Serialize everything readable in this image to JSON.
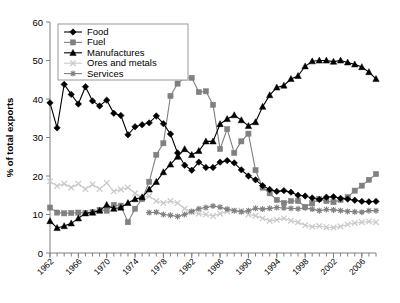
{
  "chart_data": {
    "type": "line",
    "title": "",
    "xlabel": "",
    "ylabel": "% of total exports",
    "ylim": [
      0,
      60
    ],
    "yticks": [
      0,
      10,
      20,
      30,
      40,
      50,
      60
    ],
    "xlim": [
      1962,
      2008
    ],
    "xticks": [
      1962,
      1966,
      1970,
      1974,
      1978,
      1982,
      1986,
      1990,
      1994,
      1998,
      2002,
      2006
    ],
    "xtick_step_minor": 1,
    "grid": false,
    "legend_position": "top-left-inside",
    "x": [
      1962,
      1963,
      1964,
      1965,
      1966,
      1967,
      1968,
      1969,
      1970,
      1971,
      1972,
      1973,
      1974,
      1975,
      1976,
      1977,
      1978,
      1979,
      1980,
      1981,
      1982,
      1983,
      1984,
      1985,
      1986,
      1987,
      1988,
      1989,
      1990,
      1991,
      1992,
      1993,
      1994,
      1995,
      1996,
      1997,
      1998,
      1999,
      2000,
      2001,
      2002,
      2003,
      2004,
      2005,
      2006,
      2007,
      2008
    ],
    "series": [
      {
        "name": "Food",
        "marker": "diamond",
        "color": "#000000",
        "values": [
          39.0,
          32.5,
          43.8,
          41.2,
          38.7,
          43.2,
          39.5,
          38.2,
          39.7,
          36.3,
          35.7,
          30.7,
          32.8,
          33.3,
          33.8,
          35.6,
          33.6,
          30.9,
          26.0,
          22.8,
          21.5,
          23.6,
          22.2,
          22.2,
          23.6,
          24.0,
          23.4,
          21.6,
          20.0,
          19.0,
          17.5,
          16.5,
          16.0,
          16.2,
          15.8,
          15.0,
          14.8,
          14.3,
          13.9,
          14.5,
          14.6,
          14.2,
          14.0,
          13.7,
          13.4,
          13.3,
          13.4
        ]
      },
      {
        "name": "Fuel",
        "marker": "square",
        "color": "#808080",
        "values": [
          11.8,
          10.5,
          10.3,
          10.4,
          10.5,
          10.4,
          10.6,
          11.2,
          11.0,
          12.5,
          12.3,
          8.0,
          11.5,
          14.0,
          18.5,
          25.5,
          28.5,
          40.8,
          44.0,
          45.6,
          45.5,
          41.8,
          42.0,
          38.5,
          27.0,
          32.2,
          26.0,
          29.0,
          31.0,
          21.5,
          17.0,
          15.5,
          13.8,
          13.0,
          13.5,
          13.5,
          12.0,
          12.9,
          14.0,
          13.5,
          13.2,
          13.8,
          14.5,
          16.2,
          17.5,
          19.0,
          20.5
        ]
      },
      {
        "name": "Manufactures",
        "marker": "triangle",
        "color": "#000000",
        "values": [
          8.3,
          6.5,
          7.0,
          7.7,
          9.0,
          10.3,
          10.5,
          11.0,
          12.5,
          11.5,
          11.8,
          13.0,
          14.0,
          14.5,
          16.5,
          18.5,
          21.0,
          23.0,
          25.0,
          27.0,
          25.5,
          26.5,
          29.0,
          29.0,
          33.5,
          34.8,
          35.8,
          34.5,
          33.0,
          34.0,
          38.0,
          41.0,
          43.0,
          43.5,
          45.2,
          46.0,
          48.5,
          49.8,
          50.0,
          50.0,
          49.7,
          50.0,
          49.5,
          49.0,
          48.3,
          47.0,
          45.2
        ]
      },
      {
        "name": "Ores and metals",
        "marker": "cross",
        "color": "#c9c9c9",
        "values": [
          18.6,
          17.4,
          18.0,
          17.0,
          18.0,
          16.6,
          17.8,
          16.6,
          18.2,
          16.0,
          16.5,
          17.0,
          15.5,
          14.4,
          14.8,
          13.5,
          13.0,
          13.5,
          13.0,
          11.5,
          10.6,
          10.2,
          10.0,
          9.6,
          10.2,
          10.8,
          11.0,
          11.0,
          10.0,
          9.7,
          9.0,
          8.4,
          8.6,
          9.0,
          8.4,
          8.0,
          7.2,
          6.8,
          7.0,
          6.7,
          6.6,
          6.9,
          7.4,
          7.8,
          8.0,
          8.2,
          8.0
        ]
      },
      {
        "name": "Services",
        "marker": "star",
        "color": "#808080",
        "values": [
          null,
          null,
          null,
          null,
          null,
          null,
          null,
          null,
          null,
          null,
          null,
          null,
          null,
          null,
          10.5,
          10.6,
          10.0,
          9.8,
          9.5,
          10.0,
          10.8,
          11.5,
          11.8,
          12.2,
          11.9,
          11.4,
          11.0,
          10.7,
          11.0,
          11.6,
          11.4,
          11.6,
          11.8,
          11.7,
          11.6,
          11.5,
          11.7,
          11.4,
          11.0,
          11.3,
          11.2,
          11.0,
          10.8,
          10.7,
          10.6,
          11.0,
          11.0
        ]
      }
    ]
  },
  "legend": {
    "items": [
      {
        "label": "Food"
      },
      {
        "label": "Fuel"
      },
      {
        "label": "Manufactures"
      },
      {
        "label": "Ores and metals"
      },
      {
        "label": "Services"
      }
    ]
  },
  "axes": {
    "y_title": "% of total exports",
    "y_tick_labels": [
      "0",
      "10",
      "20",
      "30",
      "40",
      "50",
      "60"
    ],
    "x_tick_labels": [
      "1962",
      "1966",
      "1970",
      "1974",
      "1978",
      "1982",
      "1986",
      "1990",
      "1994",
      "1998",
      "2002",
      "2006"
    ]
  }
}
